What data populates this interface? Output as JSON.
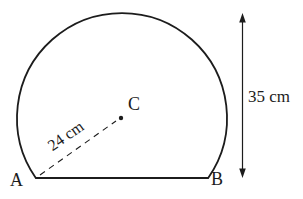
{
  "colors": {
    "ink": "#1c1c1c",
    "background": "#ffffff"
  },
  "figure": {
    "labels": {
      "vertex_a": "A",
      "vertex_b": "B",
      "center": "C",
      "radius": "24 cm",
      "height": "35 cm"
    }
  }
}
